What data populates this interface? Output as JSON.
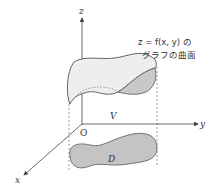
{
  "diagram": {
    "axes": {
      "z_label": "z",
      "y_label": "y",
      "x_label": "x",
      "origin_label": "O"
    },
    "surface_caption": {
      "line1": "z = f(x, y) の",
      "line2": "グラフの曲面"
    },
    "volume_label": "V",
    "region_label": "D",
    "colors": {
      "surface_fill": "#eeeeee",
      "surface_underside_fill": "#c8c8c8",
      "region_fill": "#c4c4c4",
      "stroke": "#555555"
    }
  }
}
